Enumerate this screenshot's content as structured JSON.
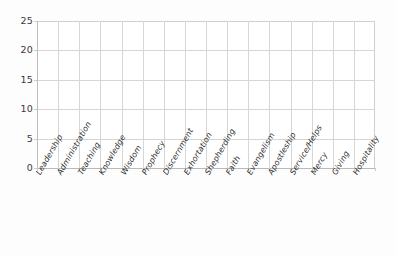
{
  "chart_data": {
    "type": "bar",
    "title": "",
    "subtitle": "",
    "xlabel": "",
    "ylabel": "",
    "ylim": [
      0,
      25
    ],
    "ytick_step": 5,
    "yticks": [
      25,
      20,
      15,
      10,
      5,
      0
    ],
    "grid": true,
    "grid_axis": "both",
    "legend": false,
    "legend_position": "none",
    "categories": [
      "Leadership",
      "Administration",
      "Teaching",
      "Knowledge",
      "Wisdom",
      "Prophecy",
      "Discernment",
      "Exhortation",
      "Shepherding",
      "Faith",
      "Evangelism",
      "Apostleship",
      "Service/Helps",
      "Mercy",
      "Giving",
      "Hospitality"
    ],
    "values": [
      0,
      0,
      0,
      0,
      0,
      0,
      0,
      0,
      0,
      0,
      0,
      0,
      0,
      0,
      0,
      0
    ],
    "annotations": []
  },
  "style": {
    "background_color": "#fdfdfd",
    "plot_background_color": "#ffffff",
    "gridline_color": "#d6d6d6",
    "axis_line_color": "#b9b9b9",
    "tick_label_color": "#3a3a3a",
    "category_label_color": "#2f2f2f",
    "bar_color": "#4a7ebb"
  }
}
